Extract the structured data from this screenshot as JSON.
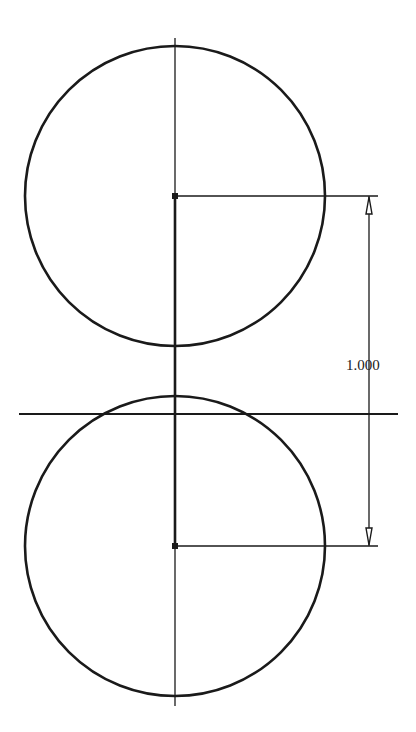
{
  "drawing": {
    "background": "#ffffff",
    "stroke_color": "#1a1a1a",
    "circles": [
      {
        "name": "upper-circle",
        "cx": 175,
        "cy": 196,
        "r": 150
      },
      {
        "name": "lower-circle",
        "cx": 175,
        "cy": 546,
        "r": 150
      }
    ],
    "centerline": {
      "x": 175,
      "y1": 38,
      "y2": 706
    },
    "center_link": {
      "x": 175,
      "y1": 196,
      "y2": 546
    },
    "horizontal_line": {
      "y": 414,
      "x1": 19,
      "x2": 398
    },
    "dimension": {
      "label": "1.000",
      "x": 369,
      "y1": 196,
      "y2": 546,
      "extension_from_x": 175,
      "extension_to_x": 378,
      "label_x": 346,
      "label_y": 358
    }
  }
}
